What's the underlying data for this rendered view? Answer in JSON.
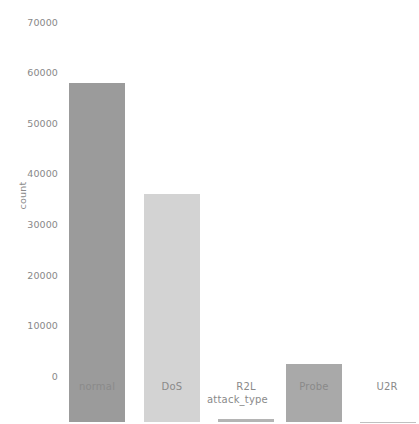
{
  "chart_data": {
    "type": "bar",
    "title": "",
    "subtitle": "",
    "xlabel": "attack_type",
    "ylabel": "count",
    "categories": [
      "normal",
      "DoS",
      "R2L",
      "Probe",
      "U2R"
    ],
    "values": [
      67000,
      45000,
      500,
      11500,
      50
    ],
    "ylim": [
      0,
      70000
    ],
    "xlim_categories": 5,
    "yticks": [
      0,
      10000,
      20000,
      30000,
      40000,
      50000,
      60000,
      70000
    ],
    "ytick_labels": [
      "0",
      "10000",
      "20000",
      "30000",
      "40000",
      "50000",
      "60000",
      "70000"
    ],
    "grid": false,
    "legend": null,
    "legend_position": "none",
    "bar_colors": [
      "#9b9b9b",
      "#d3d3d3",
      "#b4b4b4",
      "#a9a9a9",
      "#c0c0c0"
    ],
    "annotations": []
  },
  "axes": {
    "y_title": "count",
    "x_title": "attack_type",
    "tick_color": "#8a8a8a"
  },
  "bars": [
    {
      "label": "normal",
      "value": 67000,
      "color": "#9b9b9b"
    },
    {
      "label": "DoS",
      "value": 45000,
      "color": "#d3d3d3"
    },
    {
      "label": "R2L",
      "value": 500,
      "color": "#b4b4b4"
    },
    {
      "label": "Probe",
      "value": 11500,
      "color": "#a9a9a9"
    },
    {
      "label": "U2R",
      "value": 50,
      "color": "#c0c0c0"
    }
  ],
  "yticks": [
    {
      "label": "70000",
      "value": 70000
    },
    {
      "label": "60000",
      "value": 60000
    },
    {
      "label": "50000",
      "value": 50000
    },
    {
      "label": "40000",
      "value": 40000
    },
    {
      "label": "30000",
      "value": 30000
    },
    {
      "label": "20000",
      "value": 20000
    },
    {
      "label": "10000",
      "value": 10000
    },
    {
      "label": "0",
      "value": 0
    }
  ]
}
